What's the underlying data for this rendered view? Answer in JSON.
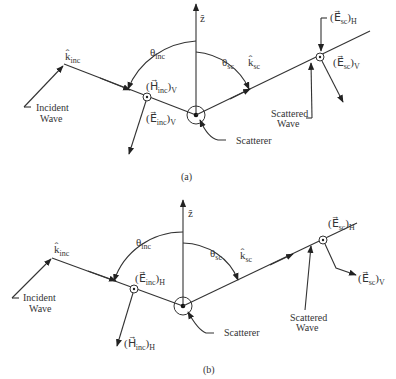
{
  "figure": {
    "panels": [
      {
        "id": "a",
        "caption": "(a)",
        "z_axis_label": "ẑ",
        "theta_inc": {
          "symbol": "θ",
          "sub": "inc"
        },
        "theta_sc": {
          "symbol": "θ",
          "sub": "sc"
        },
        "k_inc": {
          "symbol": "k̂",
          "sub": "inc"
        },
        "k_sc": {
          "symbol": "k̂",
          "sub": "sc"
        },
        "incident_field_dot": {
          "text": "(H⃗",
          "sub": "inc",
          "suffix": ")",
          "pol": "V"
        },
        "incident_field_arrow": {
          "text": "(E⃗",
          "sub": "inc",
          "suffix": ")",
          "pol": "V"
        },
        "scattered_field_dot": {
          "text": "(E⃗",
          "sub": "sc",
          "suffix": ")",
          "pol": "H"
        },
        "scattered_field_arrow": {
          "text": "(E⃗",
          "sub": "sc",
          "suffix": ")",
          "pol": "V"
        },
        "incident_wave_label": [
          "Incident",
          "Wave"
        ],
        "scattered_wave_label": [
          "Scattered",
          "Wave"
        ],
        "scatterer_label": "Scatterer"
      },
      {
        "id": "b",
        "caption": "(b)",
        "z_axis_label": "ẑ",
        "theta_inc": {
          "symbol": "θ",
          "sub": "inc"
        },
        "theta_sc": {
          "symbol": "θ",
          "sub": "sc"
        },
        "k_inc": {
          "symbol": "k̂",
          "sub": "inc"
        },
        "k_sc": {
          "symbol": "k̂",
          "sub": "sc"
        },
        "incident_field_dot": {
          "text": "(E⃗",
          "sub": "inc",
          "suffix": ")",
          "pol": "H"
        },
        "incident_field_arrow": {
          "text": "(H⃗",
          "sub": "inc",
          "suffix": ")",
          "pol": "H"
        },
        "scattered_field_dot": {
          "text": "(E⃗",
          "sub": "sc",
          "suffix": ")",
          "pol": "H"
        },
        "scattered_field_arrow": {
          "text": "(E⃗",
          "sub": "sc",
          "suffix": ")",
          "pol": "V"
        },
        "incident_wave_label": [
          "Incident",
          "Wave"
        ],
        "scattered_wave_label": [
          "Scattered",
          "Wave"
        ],
        "scatterer_label": "Scatterer"
      }
    ]
  }
}
